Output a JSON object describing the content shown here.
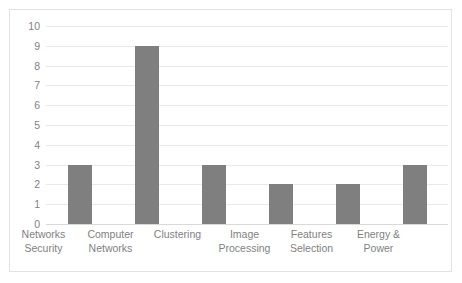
{
  "chart_data": {
    "type": "bar",
    "title": "",
    "subtitle": "",
    "xlabel": "",
    "ylabel": "",
    "categories": [
      "Networks Security",
      "Computer Networks",
      "Clustering",
      "Image Processing",
      "Features Selection",
      "Energy & Power"
    ],
    "category_lines": [
      [
        "Networks",
        "Security"
      ],
      [
        "Computer",
        "Networks"
      ],
      [
        "Clustering"
      ],
      [
        "Image",
        "Processing"
      ],
      [
        "Features",
        "Selection"
      ],
      [
        "Energy &",
        "Power"
      ]
    ],
    "values": [
      3,
      9,
      3,
      2,
      2,
      3
    ],
    "ylim": [
      0,
      10
    ],
    "ytick_labels": [
      "10",
      "9",
      "8",
      "7",
      "6",
      "5",
      "4",
      "3",
      "2",
      "1",
      "0"
    ],
    "ytick_values": [
      10,
      9,
      8,
      7,
      6,
      5,
      4,
      3,
      2,
      1,
      0
    ],
    "ytick_step": 1,
    "grid": true,
    "legend": false,
    "legend_position": "none",
    "bar_color": "#7f7f7f",
    "grid_color": "#e9e9e9",
    "axis_text_color": "#7f7f7f",
    "border_color": "#e2e2e2",
    "background_color": "#ffffff"
  }
}
